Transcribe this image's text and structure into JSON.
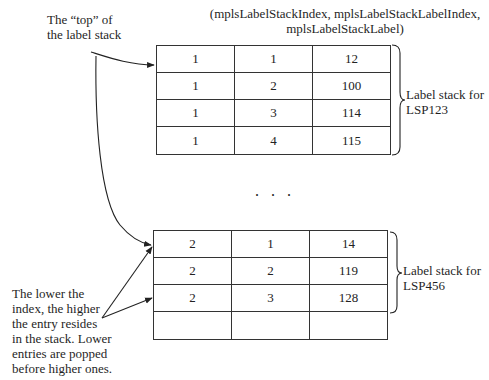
{
  "header": {
    "line1": "(mplsLabelStackIndex, mplsLabelStackLabelIndex,",
    "line2": "mplsLabelStackLabel)"
  },
  "top_note": {
    "line1": "The “top” of",
    "line2": "the label stack"
  },
  "bottom_note": {
    "line1": "The lower the",
    "line2": "index, the higher",
    "line3": "the entry resides",
    "line4": "in the stack. Lower",
    "line5": "entries are popped",
    "line6": "before higher ones."
  },
  "table1": {
    "rows": [
      [
        "1",
        "1",
        "12"
      ],
      [
        "1",
        "2",
        "100"
      ],
      [
        "1",
        "3",
        "114"
      ],
      [
        "1",
        "4",
        "115"
      ]
    ],
    "brace_label": {
      "line1": "Label stack for",
      "line2": "LSP123"
    }
  },
  "ellipsis": ". . .",
  "table2": {
    "rows": [
      [
        "2",
        "1",
        "14"
      ],
      [
        "2",
        "2",
        "119"
      ],
      [
        "2",
        "3",
        "128"
      ],
      [
        "",
        "",
        ""
      ]
    ],
    "brace_label": {
      "line1": "Label stack for",
      "line2": "LSP456"
    }
  }
}
